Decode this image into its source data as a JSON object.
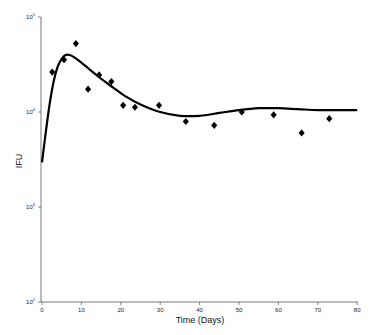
{
  "chart_data": {
    "type": "scatter",
    "title": "",
    "xlabel": "Time (Days)",
    "ylabel": "IFU",
    "xlim": [
      0,
      80
    ],
    "ylim_log10": [
      2,
      5
    ],
    "yscale": "log",
    "grid": false,
    "legend": null,
    "x_ticks": [
      0,
      10,
      20,
      30,
      40,
      50,
      60,
      70,
      80
    ],
    "y_ticks": [
      {
        "base": "10",
        "exp": "5",
        "log": 5
      },
      {
        "base": "10",
        "exp": "4",
        "log": 4
      },
      {
        "base": "10",
        "exp": "3",
        "log": 3
      },
      {
        "base": "10",
        "exp": "2",
        "log": 2
      }
    ],
    "series": [
      {
        "name": "observed",
        "kind": "scatter",
        "marker": "diamond",
        "x": [
          2.6,
          5.6,
          8.6,
          11.7,
          14.5,
          17.6,
          20.6,
          23.6,
          29.7,
          36.5,
          43.7,
          50.7,
          58.8,
          65.9,
          72.9
        ],
        "log10_y": [
          4.42,
          4.55,
          4.72,
          4.24,
          4.39,
          4.32,
          4.07,
          4.05,
          4.07,
          3.9,
          3.86,
          4.0,
          3.97,
          3.78,
          3.93
        ],
        "y": [
          26500,
          35700,
          53000,
          17400,
          24500,
          20800,
          11800,
          11100,
          11600,
          8000,
          7200,
          10000,
          9300,
          6000,
          8400
        ]
      },
      {
        "name": "model",
        "kind": "line",
        "x": [
          0,
          1,
          2,
          3,
          4,
          5,
          6,
          7,
          8,
          10,
          12,
          15,
          18,
          21,
          25,
          30,
          35,
          40,
          45,
          50,
          55,
          60,
          65,
          70,
          75,
          80
        ],
        "log10_y": [
          3.47,
          3.8,
          4.1,
          4.33,
          4.48,
          4.56,
          4.6,
          4.6,
          4.58,
          4.52,
          4.45,
          4.35,
          4.26,
          4.17,
          4.08,
          4.0,
          3.96,
          3.96,
          3.99,
          4.02,
          4.04,
          4.04,
          4.03,
          4.02,
          4.02,
          4.02
        ]
      }
    ]
  }
}
